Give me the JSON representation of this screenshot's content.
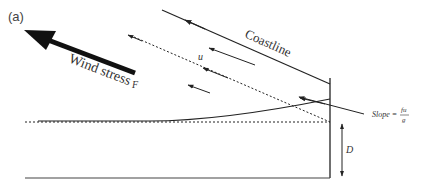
{
  "figure": {
    "panel_label": "(a)",
    "labels": {
      "wind_stress": "Wind stress",
      "force": "F",
      "coastline": "Coastline",
      "velocity": "u",
      "slope_prefix": "Slope =",
      "slope_numerator": "fu",
      "slope_denominator": "g",
      "depth": "D"
    },
    "colors": {
      "line": "#222222",
      "text": "#333333",
      "background": "#ffffff"
    }
  }
}
